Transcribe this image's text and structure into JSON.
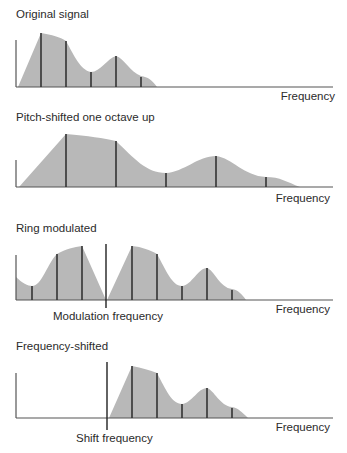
{
  "panels": [
    {
      "title": "Original signal",
      "x_label": "Frequency",
      "harmonics_x": [
        41,
        66,
        91,
        116,
        141
      ],
      "harmonic_tops": [
        33,
        41,
        72,
        56,
        77
      ]
    },
    {
      "title": "Pitch-shifted one octave up",
      "x_label": "Frequency",
      "harmonics_x": [
        66,
        116,
        166,
        216,
        266
      ],
      "harmonic_tops": [
        134,
        141,
        173,
        156,
        177
      ]
    },
    {
      "title": "Ring modulated",
      "x_label": "Frequency",
      "marker_label": "Modulation frequency",
      "harmonics_x": [
        32,
        57,
        82,
        132,
        157,
        182,
        207,
        232
      ],
      "harmonic_tops": [
        286,
        254,
        246,
        246,
        254,
        286,
        268,
        290
      ]
    },
    {
      "title": "Frequency-shifted",
      "x_label": "Frequency",
      "marker_label": "Shift frequency",
      "harmonics_x": [
        132,
        157,
        182,
        207,
        232
      ],
      "harmonic_tops": [
        366,
        373,
        404,
        388,
        408
      ]
    }
  ],
  "colors": {
    "fill": "#b8b8b8",
    "lines": "#333333",
    "background": "#ffffff"
  }
}
